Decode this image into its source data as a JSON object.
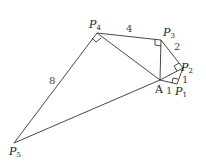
{
  "diagram": {
    "title": "",
    "points": {
      "A": {
        "label": "A",
        "sub": "",
        "x": 160,
        "y": 80
      },
      "P1": {
        "label": "P",
        "sub": "1",
        "x": 177,
        "y": 84
      },
      "P2": {
        "label": "P",
        "sub": "2",
        "x": 183,
        "y": 68
      },
      "P3": {
        "label": "P",
        "sub": "3",
        "x": 161,
        "y": 40
      },
      "P4": {
        "label": "P",
        "sub": "4",
        "x": 97,
        "y": 33
      },
      "P5": {
        "label": "P",
        "sub": "5",
        "x": 14,
        "y": 143
      }
    },
    "segments": [
      {
        "from": "A",
        "to": "P1"
      },
      {
        "from": "P1",
        "to": "P2"
      },
      {
        "from": "P2",
        "to": "P3"
      },
      {
        "from": "P3",
        "to": "P4"
      },
      {
        "from": "P4",
        "to": "P5"
      },
      {
        "from": "A",
        "to": "P2"
      },
      {
        "from": "A",
        "to": "P3"
      },
      {
        "from": "A",
        "to": "P4"
      },
      {
        "from": "A",
        "to": "P5"
      }
    ],
    "lengths": {
      "AP1": "1",
      "P1P2": "1",
      "P2P3": "2",
      "P3P4": "4",
      "P4P5": "8"
    },
    "right_angles": [
      "P1",
      "P2",
      "P3",
      "P4"
    ],
    "colors": {
      "stroke": "#333333",
      "label": "#222222"
    }
  }
}
